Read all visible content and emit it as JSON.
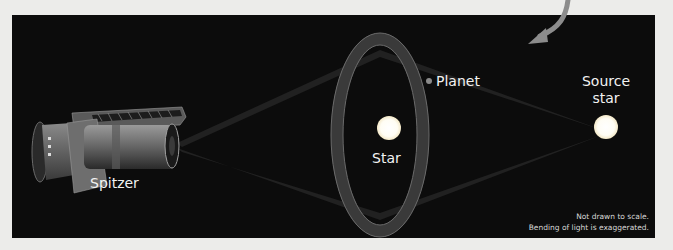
{
  "diagram": {
    "title_hint": "Gravitational microlensing detection of a planet by Spitzer",
    "labels": {
      "spitzer": "Spitzer",
      "star": "Star",
      "planet": "Planet",
      "source_star_line1": "Source",
      "source_star_line2": "star"
    },
    "notes": {
      "line1": "Not drawn to scale.",
      "line2": "Bending of light is exaggerated."
    },
    "colors": {
      "background": "#0c0c0c",
      "outer_background": "#ececea",
      "star": "#ffffff",
      "ring": "#5a5a5a",
      "beam": "#2a2a2a",
      "arrow": "#8c8c8c",
      "text": "#f2f2f2"
    }
  }
}
